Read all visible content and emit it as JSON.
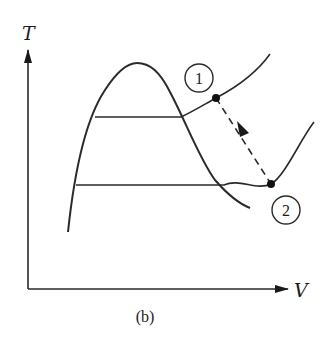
{
  "figure": {
    "caption": "(b)",
    "axes": {
      "y_label": "T",
      "x_label": "V"
    },
    "states": [
      {
        "id": "1",
        "label": "1"
      },
      {
        "id": "2",
        "label": "2"
      }
    ],
    "process": {
      "from": "1",
      "to": "2",
      "style": "dashed-arrow"
    },
    "elements": [
      "saturation-dome",
      "upper-isotherm",
      "lower-isotherm"
    ],
    "colors": {
      "line": "#2a2a2a",
      "background": "#ffffff"
    }
  }
}
